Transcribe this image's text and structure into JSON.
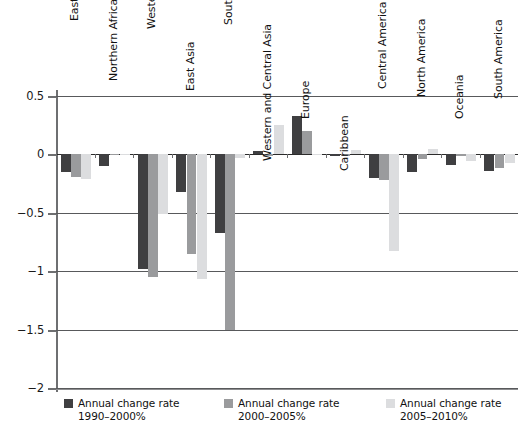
{
  "chart_data": {
    "type": "bar",
    "title": "",
    "subtitle": "",
    "xlabel": "",
    "ylabel": "",
    "ylim": [
      -2,
      0.5
    ],
    "ytick_labels": [
      "0.5",
      "0",
      "−0.5",
      "−1",
      "−1.5",
      "−2"
    ],
    "ytick_values": [
      0.5,
      0,
      -0.5,
      -1,
      -1.5,
      -2
    ],
    "grid": true,
    "legend_position": "bottom",
    "orientation": "vertical",
    "grouping": "grouped",
    "categories": [
      "Eastern and Southern Africa",
      "Northern Africa",
      "Western and Central Africa",
      "East Asia",
      "South and Southeast Asia",
      "Western and Central Asia",
      "Europe",
      "Caribbean",
      "Central America",
      "North America",
      "Oceania",
      "South America"
    ],
    "series": [
      {
        "name": "Annual change rate 1990–2000%",
        "color": "#3f3f41",
        "values": [
          -0.15,
          -0.1,
          -0.98,
          -0.32,
          -0.67,
          0.03,
          0.33,
          -0.01,
          -0.2,
          -0.15,
          -0.09,
          -0.14
        ]
      },
      {
        "name": "Annual change rate 2000–2005%",
        "color": "#9a9b9d",
        "values": [
          -0.19,
          0.0,
          -1.05,
          -0.85,
          -1.5,
          -0.01,
          0.2,
          -0.01,
          -0.22,
          -0.04,
          -0.01,
          -0.12
        ]
      },
      {
        "name": "Annual change rate 2005–2010%",
        "color": "#dcdddf",
        "values": [
          -0.21,
          0.0,
          -0.51,
          -1.07,
          -0.03,
          0.25,
          0.0,
          0.04,
          -0.83,
          0.05,
          -0.06,
          -0.07
        ]
      }
    ]
  },
  "legend": {
    "items": [
      {
        "label_line1": "Annual change rate",
        "label_line2": "1990–2000%",
        "color": "#3f3f41",
        "swatch_name": "legend-swatch-1990-2000"
      },
      {
        "label_line1": "Annual change rate",
        "label_line2": "2000–2005%",
        "color": "#9a9b9d",
        "swatch_name": "legend-swatch-2000-2005"
      },
      {
        "label_line1": "Annual change rate",
        "label_line2": "2005–2010%",
        "color": "#dcdddf",
        "swatch_name": "legend-swatch-2005-2010"
      }
    ]
  },
  "axis": {
    "y_labels": [
      "0.5",
      "0",
      "−0.5",
      "−1",
      "−1.5",
      "−2"
    ]
  },
  "colors": {
    "series_1": "#3f3f41",
    "series_2": "#9a9b9d",
    "series_3": "#dcdddf",
    "gridline": "#58595b",
    "axis": "#6e6f71",
    "text": "#111111",
    "background": "#ffffff"
  }
}
